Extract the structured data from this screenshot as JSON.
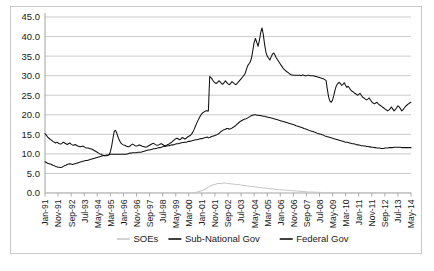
{
  "chart_data": {
    "type": "line",
    "title": "",
    "xlabel": "",
    "ylabel": "",
    "ylim": [
      0.0,
      45.0
    ],
    "ytick_step": 5.0,
    "ytick_labels": [
      "0.0",
      "5.0",
      "10.0",
      "15.0",
      "20.0",
      "25.0",
      "30.0",
      "35.0",
      "40.0",
      "45.0"
    ],
    "grid": true,
    "legend_position": "bottom",
    "x_start": "Jan-91",
    "x_end": "May-14",
    "x_label_interval_months": 10,
    "x_tick_labels": [
      "Jan-91",
      "Nov-91",
      "Sep-92",
      "Jul-93",
      "May-94",
      "Mar-95",
      "Jan-96",
      "Nov-96",
      "Sep-97",
      "Jul-98",
      "May-99",
      "Mar-00",
      "Jan-01",
      "Nov-01",
      "Sep-02",
      "Jul-03",
      "May-04",
      "Mar-05",
      "Jan-06",
      "Nov-06",
      "Sep-07",
      "Jul-08",
      "May-09",
      "Mar-10",
      "Jan-11",
      "Nov-11",
      "Sep-12",
      "Jul-13",
      "May-14"
    ],
    "series": [
      {
        "name": "SOEs",
        "color": "#c9c9c9",
        "values": [
          0.05,
          0.05,
          0.05,
          0.05,
          0.05,
          0.05,
          0.05,
          0.05,
          0.05,
          0.05,
          0.05,
          0.05,
          0.05,
          0.05,
          0.05,
          0.05,
          0.05,
          0.05,
          0.05,
          0.05,
          0.05,
          0.05,
          0.05,
          0.05,
          0.05,
          0.05,
          0.05,
          0.05,
          0.05,
          0.05,
          0.05,
          0.05,
          0.05,
          0.05,
          0.05,
          0.05,
          0.05,
          0.05,
          0.05,
          0.05,
          0.05,
          0.05,
          0.05,
          0.05,
          0.05,
          0.05,
          0.05,
          0.05,
          0.05,
          0.05,
          0.05,
          0.05,
          0.05,
          0.05,
          0.05,
          0.05,
          0.05,
          0.05,
          0.05,
          0.05,
          0.05,
          0.05,
          0.05,
          0.05,
          0.05,
          0.05,
          0.05,
          0.05,
          0.05,
          0.05,
          0.05,
          0.05,
          0.05,
          0.05,
          0.05,
          0.05,
          0.05,
          0.05,
          0.05,
          0.05,
          0.05,
          0.05,
          0.05,
          0.05,
          0.05,
          0.05,
          0.05,
          0.05,
          0.05,
          0.05,
          0.05,
          0.05,
          0.05,
          0.05,
          0.05,
          0.05,
          0.05,
          0.05,
          0.05,
          0.05,
          0.05,
          0.05,
          0.05,
          0.05,
          0.05,
          0.05,
          0.05,
          0.05,
          0.05,
          0.05,
          0.05,
          0.05,
          0.05,
          0.05,
          0.05,
          0.1,
          0.2,
          0.3,
          0.4,
          0.5,
          0.6,
          0.7,
          0.9,
          1.1,
          1.3,
          1.5,
          1.7,
          1.9,
          2.0,
          2.1,
          2.2,
          2.3,
          2.4,
          2.5,
          2.45,
          2.4,
          2.5,
          2.6,
          2.55,
          2.5,
          2.45,
          2.4,
          2.35,
          2.3,
          2.3,
          2.25,
          2.2,
          2.2,
          2.15,
          2.1,
          2.05,
          2.0,
          1.95,
          1.9,
          1.85,
          1.8,
          1.75,
          1.7,
          1.68,
          1.65,
          1.6,
          1.55,
          1.5,
          1.45,
          1.4,
          1.38,
          1.35,
          1.3,
          1.28,
          1.25,
          1.2,
          1.15,
          1.1,
          1.08,
          1.05,
          1.0,
          0.95,
          0.9,
          0.88,
          0.85,
          0.82,
          0.8,
          0.78,
          0.75,
          0.72,
          0.7,
          0.68,
          0.65,
          0.62,
          0.6,
          0.58,
          0.55,
          0.52,
          0.5,
          0.48,
          0.45,
          0.42,
          0.4,
          0.38,
          0.35,
          0.33,
          0.3,
          0.28,
          0.26,
          0.25,
          0.24,
          0.22,
          0.2,
          0.2,
          0.18,
          0.18,
          0.16,
          0.15,
          0.15,
          0.14,
          0.13,
          0.12,
          0.12,
          0.11,
          0.1,
          0.1,
          0.1,
          0.1,
          0.1,
          0.1,
          0.1,
          0.1,
          0.1,
          0.1,
          0.1,
          0.1,
          0.1,
          0.1,
          0.1,
          0.1,
          0.1,
          0.1,
          0.1,
          0.1,
          0.1,
          0.1,
          0.1,
          0.1,
          0.1,
          0.1,
          0.1,
          0.1,
          0.1,
          0.1,
          0.1,
          0.1,
          0.1,
          0.1,
          0.1,
          0.1,
          0.1,
          0.1,
          0.1,
          0.1,
          0.1,
          0.1,
          0.1,
          0.1,
          0.1,
          0.1,
          0.1,
          0.1,
          0.1,
          0.1,
          0.1,
          0.1,
          0.1,
          0.1,
          0.1,
          0.1,
          0.1,
          0.1,
          0.1,
          0.1,
          0.1,
          0.1
        ]
      },
      {
        "name": "Sub-National Gov",
        "color": "#111111",
        "values": [
          8.0,
          7.8,
          7.6,
          7.5,
          7.4,
          7.3,
          7.1,
          7.0,
          6.8,
          6.7,
          6.6,
          6.6,
          6.5,
          6.6,
          6.8,
          7.0,
          7.1,
          7.3,
          7.4,
          7.5,
          7.4,
          7.3,
          7.4,
          7.5,
          7.6,
          7.7,
          7.8,
          7.9,
          8.0,
          8.1,
          8.2,
          8.3,
          8.3,
          8.4,
          8.5,
          8.6,
          8.7,
          8.8,
          8.9,
          9.0,
          9.1,
          9.2,
          9.3,
          9.4,
          9.5,
          9.5,
          9.6,
          9.7,
          9.7,
          9.8,
          9.9,
          9.9,
          9.9,
          9.9,
          9.9,
          9.9,
          9.9,
          9.9,
          9.9,
          9.9,
          9.9,
          9.9,
          9.9,
          10.0,
          10.1,
          10.2,
          10.2,
          10.3,
          10.3,
          10.3,
          10.3,
          10.4,
          10.4,
          10.4,
          10.5,
          10.6,
          10.7,
          10.8,
          10.9,
          11.0,
          11.0,
          11.1,
          11.2,
          11.3,
          11.3,
          11.4,
          11.5,
          11.6,
          11.6,
          11.7,
          11.8,
          11.9,
          11.9,
          12.0,
          12.1,
          12.1,
          12.2,
          12.3,
          12.3,
          12.4,
          12.5,
          12.6,
          12.6,
          12.7,
          12.8,
          12.9,
          12.9,
          13.0,
          13.0,
          13.1,
          13.2,
          13.2,
          13.3,
          13.4,
          13.5,
          13.6,
          13.6,
          13.7,
          13.8,
          13.9,
          13.9,
          14.0,
          14.1,
          14.2,
          14.3,
          14.1,
          14.2,
          14.4,
          14.5,
          14.6,
          14.7,
          14.8,
          15.0,
          15.2,
          15.5,
          15.8,
          16.0,
          16.2,
          16.3,
          16.5,
          16.5,
          16.3,
          16.4,
          16.6,
          16.8,
          17.0,
          17.3,
          17.6,
          17.9,
          18.2,
          18.4,
          18.6,
          18.8,
          18.9,
          19.0,
          19.2,
          19.4,
          19.6,
          19.8,
          19.9,
          20.0,
          20.0,
          19.9,
          19.9,
          19.8,
          19.8,
          19.7,
          19.6,
          19.6,
          19.5,
          19.4,
          19.3,
          19.3,
          19.2,
          19.1,
          19.0,
          18.9,
          18.8,
          18.7,
          18.6,
          18.5,
          18.4,
          18.3,
          18.2,
          18.1,
          18.0,
          17.9,
          17.8,
          17.7,
          17.6,
          17.5,
          17.4,
          17.2,
          17.1,
          17.0,
          16.9,
          16.8,
          16.7,
          16.5,
          16.4,
          16.3,
          16.2,
          16.0,
          15.9,
          15.8,
          15.7,
          15.6,
          15.5,
          15.3,
          15.2,
          15.1,
          15.0,
          14.9,
          14.8,
          14.6,
          14.5,
          14.4,
          14.3,
          14.2,
          14.1,
          14.0,
          13.9,
          13.8,
          13.7,
          13.6,
          13.5,
          13.4,
          13.3,
          13.2,
          13.1,
          13.0,
          13.0,
          12.9,
          12.8,
          12.7,
          12.6,
          12.6,
          12.5,
          12.4,
          12.3,
          12.3,
          12.2,
          12.1,
          12.1,
          12.0,
          12.0,
          11.9,
          11.9,
          11.8,
          11.8,
          11.7,
          11.7,
          11.6,
          11.6,
          11.5,
          11.5,
          11.5,
          11.4,
          11.4,
          11.4,
          11.5,
          11.5,
          11.5,
          11.6,
          11.6,
          11.6,
          11.6,
          11.7,
          11.7,
          11.7,
          11.7,
          11.7,
          11.7,
          11.6,
          11.6,
          11.6,
          11.6,
          11.6,
          11.6,
          11.6,
          11.6
        ]
      },
      {
        "name": "Federal Gov",
        "color": "#111111",
        "values": [
          15.2,
          14.8,
          14.3,
          14.0,
          13.7,
          13.5,
          13.2,
          13.0,
          12.8,
          13.0,
          12.8,
          12.6,
          12.5,
          12.7,
          13.0,
          12.8,
          12.6,
          12.4,
          12.6,
          12.8,
          12.5,
          12.3,
          12.2,
          12.4,
          12.2,
          12.0,
          11.9,
          11.8,
          11.9,
          12.0,
          11.8,
          11.6,
          11.5,
          11.5,
          11.4,
          11.3,
          11.2,
          11.0,
          10.8,
          10.6,
          10.4,
          10.2,
          10.0,
          9.9,
          9.7,
          9.6,
          9.5,
          9.5,
          9.6,
          9.8,
          10.5,
          12.0,
          14.0,
          15.8,
          16.0,
          15.2,
          14.2,
          13.4,
          12.8,
          12.5,
          12.3,
          12.2,
          12.0,
          11.9,
          11.8,
          12.0,
          12.3,
          12.5,
          12.3,
          12.1,
          12.0,
          12.1,
          12.3,
          12.2,
          12.0,
          11.9,
          11.8,
          11.7,
          11.8,
          12.0,
          12.2,
          12.4,
          12.6,
          12.7,
          12.5,
          12.3,
          12.2,
          12.3,
          12.5,
          12.6,
          12.4,
          12.2,
          12.1,
          12.2,
          12.4,
          12.5,
          12.8,
          13.0,
          13.3,
          13.6,
          13.9,
          14.0,
          13.8,
          13.6,
          13.8,
          14.2,
          14.0,
          13.8,
          14.0,
          14.3,
          14.5,
          14.7,
          15.0,
          15.5,
          16.2,
          17.0,
          17.8,
          18.5,
          19.2,
          19.8,
          20.3,
          20.6,
          20.8,
          21.0,
          21.0,
          21.0,
          29.8,
          29.5,
          29.0,
          28.5,
          28.2,
          28.0,
          28.3,
          28.7,
          28.4,
          28.0,
          27.8,
          28.2,
          28.7,
          28.3,
          27.9,
          27.7,
          28.0,
          28.5,
          28.2,
          27.9,
          27.7,
          28.0,
          28.4,
          28.8,
          29.2,
          29.6,
          30.0,
          30.5,
          31.5,
          32.5,
          33.0,
          33.5,
          34.5,
          36.5,
          38.5,
          39.5,
          38.5,
          37.5,
          39.0,
          41.0,
          42.2,
          40.5,
          38.0,
          36.0,
          35.0,
          34.5,
          34.0,
          34.8,
          35.5,
          35.8,
          35.2,
          34.5,
          34.0,
          33.5,
          33.0,
          32.5,
          32.0,
          31.6,
          31.3,
          31.0,
          30.8,
          30.5,
          30.3,
          30.2,
          30.1,
          30.1,
          30.1,
          30.1,
          30.1,
          30.1,
          30.0,
          30.2,
          30.1,
          30.0,
          30.0,
          30.1,
          30.1,
          30.0,
          30.0,
          30.0,
          29.9,
          29.8,
          29.7,
          29.6,
          29.5,
          29.4,
          29.3,
          29.2,
          29.0,
          28.8,
          26.5,
          24.5,
          23.5,
          23.2,
          23.8,
          25.0,
          26.5,
          27.5,
          28.0,
          28.3,
          28.0,
          27.5,
          27.8,
          28.2,
          27.5,
          27.0,
          27.3,
          26.8,
          26.3,
          26.0,
          25.8,
          25.5,
          25.3,
          25.0,
          25.2,
          25.5,
          25.0,
          24.5,
          24.3,
          24.0,
          23.8,
          24.0,
          24.3,
          23.8,
          23.3,
          23.0,
          22.8,
          23.0,
          23.2,
          22.8,
          22.5,
          22.3,
          22.0,
          21.8,
          21.5,
          21.3,
          21.0,
          21.2,
          21.5,
          22.0,
          21.5,
          21.0,
          21.3,
          21.8,
          22.3,
          22.0,
          21.5,
          21.0,
          21.3,
          21.8,
          22.2,
          22.5,
          22.8,
          23.0,
          23.2
        ]
      }
    ]
  },
  "legend": {
    "items": [
      {
        "label": "SOEs",
        "color": "#c9c9c9"
      },
      {
        "label": "Sub-National Gov",
        "color": "#111111"
      },
      {
        "label": "Federal Gov",
        "color": "#111111"
      }
    ]
  }
}
